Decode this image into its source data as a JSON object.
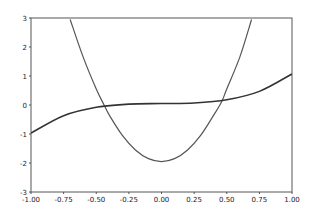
{
  "chart_data": {
    "type": "line",
    "title": "",
    "xlabel": "",
    "ylabel": "",
    "xlim": [
      -1.0,
      1.0
    ],
    "ylim": [
      -3,
      3
    ],
    "grid": false,
    "legend": null,
    "x_ticks": [
      "-1.00",
      "-0.75",
      "-0.50",
      "-0.25",
      "0.00",
      "0.25",
      "0.50",
      "0.75",
      "1.00"
    ],
    "y_ticks": [
      "-3",
      "-2",
      "-1",
      "0",
      "1",
      "2",
      "3"
    ],
    "series": [
      {
        "name": "parabola",
        "formula_estimate": "y = 10x^2 - 1.95",
        "color": "#555555",
        "x": [
          -0.7,
          -0.6,
          -0.5,
          -0.44,
          -0.4,
          -0.3,
          -0.2,
          -0.1,
          0.0,
          0.1,
          0.2,
          0.3,
          0.4,
          0.46,
          0.5,
          0.6,
          0.69
        ],
        "y": [
          2.95,
          1.65,
          0.55,
          0.0,
          -0.35,
          -1.05,
          -1.55,
          -1.85,
          -1.95,
          -1.85,
          -1.55,
          -1.05,
          -0.35,
          0.1,
          0.55,
          1.65,
          2.95
        ]
      },
      {
        "name": "cubic",
        "formula_estimate": "y = x^3 + 0.05",
        "color": "#333333",
        "x": [
          -1.0,
          -0.75,
          -0.5,
          -0.25,
          0.0,
          0.25,
          0.5,
          0.75,
          1.0
        ],
        "y": [
          -0.97,
          -0.37,
          -0.08,
          0.03,
          0.05,
          0.07,
          0.18,
          0.47,
          1.07
        ]
      }
    ]
  }
}
